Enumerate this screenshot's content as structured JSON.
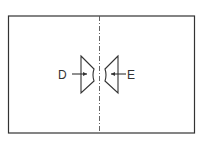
{
  "diagram": {
    "type": "hand-drawn schematic",
    "labels": {
      "left": "D",
      "right": "E"
    },
    "stroke_color": "#333333",
    "background_color": "#ffffff"
  }
}
